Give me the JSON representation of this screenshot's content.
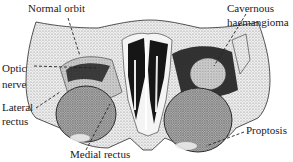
{
  "figure": {
    "colors": {
      "background": "#ffffff",
      "ink": "#1a1a1a",
      "stipple_light": "#c8c8c8",
      "stipple_mid": "#8a8a8a",
      "dark_fill": "#161616"
    }
  },
  "labels": {
    "normal_orbit": "Normal orbit",
    "cavernous_line1": "Cavernous",
    "cavernous_line2": "haemangioma",
    "optic_line1": "Optic",
    "optic_line2": "nerve",
    "lateral_line1": "Lateral",
    "lateral_line2": "rectus",
    "medial_rectus": "Medial rectus",
    "proptosis": "Proptosis"
  }
}
